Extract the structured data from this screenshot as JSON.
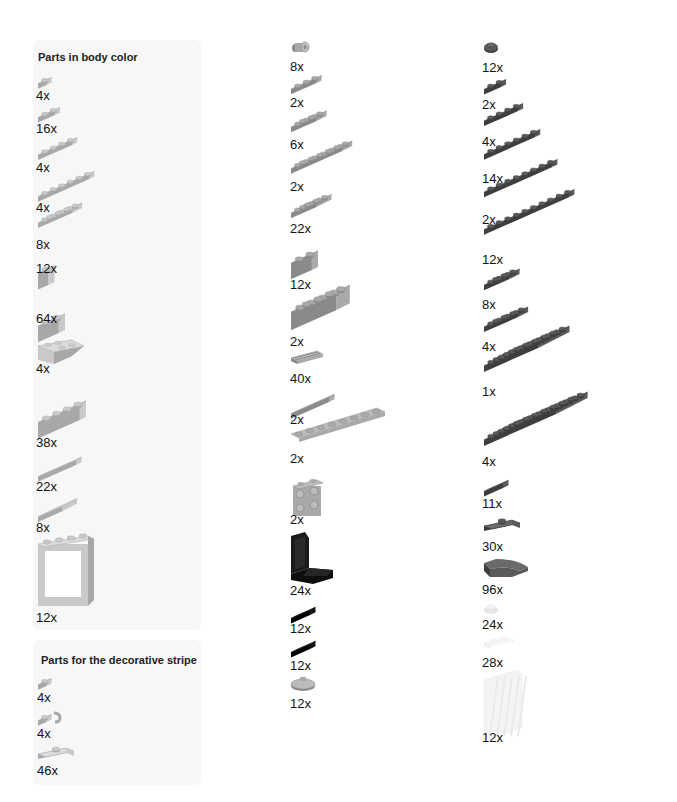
{
  "colors": {
    "light_gray": "#c9c9c9",
    "light_gray_top": "#dcdcdc",
    "light_gray_side": "#a8a8a8",
    "medium_gray": "#a9a9a9",
    "medium_gray_top": "#bcbcbc",
    "medium_gray_side": "#8a8a8a",
    "dark_gray": "#5a5a5a",
    "dark_gray_top": "#6a6a6a",
    "dark_gray_side": "#3e3e3e",
    "black": "#151515",
    "trans_clear": "#eeeeee",
    "panel_bg": "#f7f7f7"
  },
  "sections": [
    {
      "title": "Parts in body color",
      "items": [
        {
          "part": "plate-1x1",
          "qty": "4x"
        },
        {
          "part": "plate-1x2",
          "qty": "16x"
        },
        {
          "part": "plate-1x4",
          "qty": "4x"
        },
        {
          "part": "plate-1x6",
          "qty": "4x"
        },
        {
          "part": "plate-2x4",
          "qty": "8x"
        },
        {
          "part": "brick-1x1",
          "qty": "12x"
        },
        {
          "part": "brick-1x2",
          "qty": "64x"
        },
        {
          "part": "slope-inverted-2x2",
          "qty": "4x"
        },
        {
          "part": "brick-1x4",
          "qty": "38x"
        },
        {
          "part": "tile-1x4",
          "qty": "22x"
        },
        {
          "part": "tile-2x2",
          "qty": "8x"
        },
        {
          "part": "window-frame-1x4x3",
          "qty": "12x"
        }
      ]
    },
    {
      "title": "Parts for the decorative stripe",
      "items": [
        {
          "part": "plate-1x1",
          "qty": "4x"
        },
        {
          "part": "plate-1x1-clip",
          "qty": "4x"
        },
        {
          "part": "plate-1x2-jumper",
          "qty": "46x"
        }
      ]
    },
    {
      "title": "",
      "items": [
        {
          "part": "technic-pin-connector",
          "qty": "8x"
        },
        {
          "part": "plate-1x3",
          "qty": "2x"
        },
        {
          "part": "plate-2x3",
          "qty": "6x"
        },
        {
          "part": "plate-2x6",
          "qty": "2x"
        },
        {
          "part": "plate-3x3",
          "qty": "22x"
        },
        {
          "part": "technic-brick-1x2-hole",
          "qty": "12x"
        },
        {
          "part": "brick-2x4",
          "qty": "2x"
        },
        {
          "part": "tile-1x2-grooved-grille",
          "qty": "40x"
        },
        {
          "part": "tile-1x4",
          "qty": "2x"
        },
        {
          "part": "technic-plate-1x8-holes",
          "qty": "2x"
        },
        {
          "part": "bracket-1x2-2x2",
          "qty": "2x"
        },
        {
          "part": "seat-2x2",
          "qty": "24x"
        },
        {
          "part": "plate-1x2-black",
          "qty": "12x"
        },
        {
          "part": "tile-1x2-black",
          "qty": "12x"
        },
        {
          "part": "dish-2x2-round",
          "qty": "12x"
        }
      ]
    },
    {
      "title": "",
      "items": [
        {
          "part": "plate-1x1-round",
          "qty": "12x"
        },
        {
          "part": "plate-1x2",
          "qty": "2x"
        },
        {
          "part": "plate-1x4",
          "qty": "4x"
        },
        {
          "part": "plate-1x6",
          "qty": "14x"
        },
        {
          "part": "plate-1x8",
          "qty": "2x"
        },
        {
          "part": "plate-1x10",
          "qty": "12x"
        },
        {
          "part": "plate-2x3",
          "qty": "8x"
        },
        {
          "part": "plate-2x4",
          "qty": "4x"
        },
        {
          "part": "plate-6x6",
          "qty": "1x"
        },
        {
          "part": "plate-6x8",
          "qty": "4x"
        },
        {
          "part": "tile-1x2",
          "qty": "11x"
        },
        {
          "part": "plate-1x2-jumper",
          "qty": "30x"
        },
        {
          "part": "slope-curved-2x1",
          "qty": "96x"
        },
        {
          "part": "plate-1x1-round-trans",
          "qty": "24x"
        },
        {
          "part": "plate-1x2-trans",
          "qty": "28x"
        },
        {
          "part": "glass-window-1x4x3-trans",
          "qty": "12x"
        }
      ]
    }
  ]
}
